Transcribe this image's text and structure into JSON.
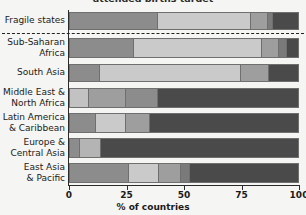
{
  "chart_data": {
    "type": "bar",
    "orientation": "horizontal",
    "stacked": true,
    "title": "attended births target",
    "xlabel": "% of countries",
    "ylabel": "",
    "xlim": [
      0,
      100
    ],
    "xticks": [
      0,
      25,
      50,
      75,
      100
    ],
    "xtick_labels": [
      "0",
      "25",
      "50",
      "75",
      "100"
    ],
    "grid": false,
    "legend": "none",
    "categories": [
      "Fragile states",
      "Sub-Saharan Africa",
      "South Asia",
      "Middle East & North Africa",
      "Latin America & Caribbean",
      "Europe & Central Asia",
      "East Asia & Pacific"
    ],
    "category_lines": [
      [
        "Fragile states"
      ],
      [
        "Sub-Saharan",
        "Africa"
      ],
      [
        "South Asia"
      ],
      [
        "Middle East &",
        "North Africa"
      ],
      [
        "Latin America",
        "& Caribbean"
      ],
      [
        "Europe &",
        "Central Asia"
      ],
      [
        "East Asia",
        "& Pacific"
      ]
    ],
    "series": [
      {
        "name": "segment-1",
        "color": "#8c8c8c",
        "values": [
          39,
          28,
          13,
          8,
          11,
          4,
          26
        ]
      },
      {
        "name": "segment-2",
        "color": "#cacaca",
        "values": [
          41,
          57,
          62,
          16,
          13,
          9,
          13
        ]
      },
      {
        "name": "segment-3",
        "color": "#9e9e9e",
        "values": [
          7,
          7,
          12,
          14,
          10,
          0,
          9
        ]
      },
      {
        "name": "segment-4",
        "color": "#7a7a7a",
        "values": [
          2,
          3,
          0,
          0,
          0,
          0,
          4
        ]
      },
      {
        "name": "segment-5",
        "color": "#4a4a4a",
        "values": [
          11,
          5,
          13,
          62,
          66,
          87,
          48
        ]
      }
    ],
    "rows": [
      {
        "label": "Fragile states",
        "segments": [
          {
            "color": "#8c8c8c",
            "value": 39
          },
          {
            "color": "#cacaca",
            "value": 41
          },
          {
            "color": "#9e9e9e",
            "value": 7
          },
          {
            "color": "#7a7a7a",
            "value": 2
          },
          {
            "color": "#4a4a4a",
            "value": 11
          }
        ]
      },
      {
        "label": "Sub-Saharan Africa",
        "segments": [
          {
            "color": "#8c8c8c",
            "value": 28
          },
          {
            "color": "#cacaca",
            "value": 57
          },
          {
            "color": "#9e9e9e",
            "value": 7
          },
          {
            "color": "#7a7a7a",
            "value": 3
          },
          {
            "color": "#4a4a4a",
            "value": 5
          }
        ]
      },
      {
        "label": "South Asia",
        "segments": [
          {
            "color": "#8c8c8c",
            "value": 13
          },
          {
            "color": "#cacaca",
            "value": 62
          },
          {
            "color": "#9e9e9e",
            "value": 12
          },
          {
            "color": "#4a4a4a",
            "value": 13
          }
        ]
      },
      {
        "label": "Middle East & North Africa",
        "segments": [
          {
            "color": "#c2c2c2",
            "value": 8
          },
          {
            "color": "#9e9e9e",
            "value": 16
          },
          {
            "color": "#8c8c8c",
            "value": 14
          },
          {
            "color": "#4a4a4a",
            "value": 62
          }
        ]
      },
      {
        "label": "Latin America & Caribbean",
        "segments": [
          {
            "color": "#8c8c8c",
            "value": 11
          },
          {
            "color": "#cacaca",
            "value": 13
          },
          {
            "color": "#9e9e9e",
            "value": 10
          },
          {
            "color": "#4a4a4a",
            "value": 66
          }
        ]
      },
      {
        "label": "Europe & Central Asia",
        "segments": [
          {
            "color": "#8c8c8c",
            "value": 4
          },
          {
            "color": "#b4b4b4",
            "value": 9
          },
          {
            "color": "#4a4a4a",
            "value": 87
          }
        ]
      },
      {
        "label": "East Asia & Pacific",
        "segments": [
          {
            "color": "#8c8c8c",
            "value": 26
          },
          {
            "color": "#cacaca",
            "value": 13
          },
          {
            "color": "#9e9e9e",
            "value": 9
          },
          {
            "color": "#7a7a7a",
            "value": 4
          },
          {
            "color": "#4a4a4a",
            "value": 48
          }
        ]
      }
    ],
    "separator_after_row": 0,
    "colors": {
      "background": "#f5f5f3",
      "axis": "#2a2a2a",
      "text": "#1a1a1a",
      "bar_outline": "#6f6f6f"
    }
  }
}
